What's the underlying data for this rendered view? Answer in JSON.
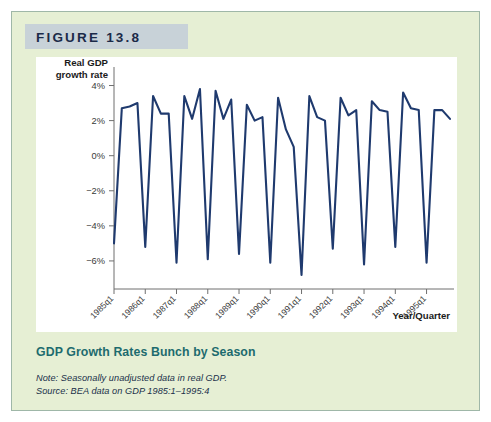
{
  "figure": {
    "header_label": "FIGURE 13.8",
    "caption_title": "GDP Growth Rates Bunch by Season",
    "note": "Note: Seasonally unadjusted data in real GDP.",
    "source": "Source: BEA data on GDP 1985:1–1995:4"
  },
  "colors": {
    "panel_background": "#e6efd4",
    "panel_border": "#9fb7a8",
    "header_band": "#c8d2d8",
    "header_text": "#1b2a48",
    "plot_background": "#ffffff",
    "series_line": "#1f3a6e",
    "caption_teal": "#1d6b6e",
    "axis_gray": "#6f6f6f"
  },
  "chart_data": {
    "type": "line",
    "title": "GDP Growth Rates Bunch by Season",
    "xlabel": "Year/Quarter",
    "ylabel": "Real GDP growth rate",
    "ylabel_lines": [
      "Real GDP",
      "growth rate"
    ],
    "ylim": [
      -7.6,
      4.6
    ],
    "yticks": [
      4,
      2,
      0,
      -2,
      -4,
      -6
    ],
    "ytick_labels": [
      "4%",
      "2%",
      "0%",
      "−2%",
      "−4%",
      "−6%"
    ],
    "grid": false,
    "legend": "none",
    "xtick_labels": [
      "1985q1",
      "1986q1",
      "1987q1",
      "1988q1",
      "1989q1",
      "1990q1",
      "1991q1",
      "1992q1",
      "1993q1",
      "1994q1",
      "1995q1"
    ],
    "xtick_indices": [
      0,
      4,
      8,
      12,
      16,
      20,
      24,
      28,
      32,
      36,
      40
    ],
    "x": [
      "1985q1",
      "1985q2",
      "1985q3",
      "1985q4",
      "1986q1",
      "1986q2",
      "1986q3",
      "1986q4",
      "1987q1",
      "1987q2",
      "1987q3",
      "1987q4",
      "1988q1",
      "1988q2",
      "1988q3",
      "1988q4",
      "1989q1",
      "1989q2",
      "1989q3",
      "1989q4",
      "1990q1",
      "1990q2",
      "1990q3",
      "1990q4",
      "1991q1",
      "1991q2",
      "1991q3",
      "1991q4",
      "1992q1",
      "1992q2",
      "1992q3",
      "1992q4",
      "1993q1",
      "1993q2",
      "1993q3",
      "1993q4",
      "1994q1",
      "1994q2",
      "1994q3",
      "1994q4",
      "1995q1",
      "1995q2",
      "1995q3",
      "1995q4"
    ],
    "values": [
      -5.0,
      2.7,
      2.8,
      3.0,
      -5.2,
      3.4,
      2.4,
      2.4,
      -6.1,
      3.4,
      2.1,
      3.8,
      -5.9,
      3.7,
      2.1,
      3.2,
      -5.6,
      2.9,
      2.0,
      2.2,
      -6.1,
      3.3,
      1.5,
      0.5,
      -6.8,
      3.4,
      2.2,
      2.0,
      -5.3,
      3.3,
      2.3,
      2.6,
      -6.2,
      3.1,
      2.6,
      2.5,
      -5.2,
      3.6,
      2.7,
      2.6,
      -6.1,
      2.6,
      2.6,
      2.1
    ],
    "series": [
      {
        "name": "Real GDP growth rate",
        "values": [
          -5.0,
          2.7,
          2.8,
          3.0,
          -5.2,
          3.4,
          2.4,
          2.4,
          -6.1,
          3.4,
          2.1,
          3.8,
          -5.9,
          3.7,
          2.1,
          3.2,
          -5.6,
          2.9,
          2.0,
          2.2,
          -6.1,
          3.3,
          1.5,
          0.5,
          -6.8,
          3.4,
          2.2,
          2.0,
          -5.3,
          3.3,
          2.3,
          2.6,
          -6.2,
          3.1,
          2.6,
          2.5,
          -5.2,
          3.6,
          2.7,
          2.6,
          -6.1,
          2.6,
          2.6,
          2.1
        ]
      }
    ]
  }
}
